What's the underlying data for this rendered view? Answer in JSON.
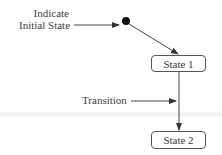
{
  "diagram": {
    "type": "state-diagram",
    "initial_state_label_line1": "Indicate",
    "initial_state_label_line2": "Initial State",
    "transition_label": "Transition",
    "states": [
      {
        "id": "state-1",
        "label": "State 1"
      },
      {
        "id": "state-2",
        "label": "State 2"
      }
    ],
    "edges": [
      {
        "from": "initial",
        "to": "State 1"
      },
      {
        "from": "State 1",
        "to": "State 2",
        "label": "Transition"
      }
    ],
    "colors": {
      "line": "#444444",
      "initial_dot": "#111111",
      "box_border": "#555555",
      "text": "#3a3a3a"
    }
  }
}
